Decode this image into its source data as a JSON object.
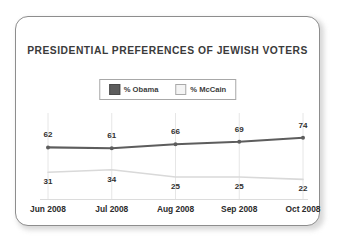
{
  "card": {
    "background": "#ffffff",
    "border_color": "#8d8d8d"
  },
  "chart_data": {
    "type": "line",
    "title": "PRESIDENTIAL PREFERENCES OF JEWISH VOTERS",
    "xlabel": "",
    "ylabel": "",
    "ylim": [
      0,
      100
    ],
    "grid": "vertical-only",
    "legend_position": "top-center",
    "categories": [
      "Jun 2008",
      "Jul 2008",
      "Aug 2008",
      "Sep 2008",
      "Oct 2008"
    ],
    "series": [
      {
        "name": "% Obama",
        "color": "#5d5d5d",
        "marker": "circle",
        "label_position": "above",
        "values": [
          62,
          61,
          66,
          69,
          74
        ]
      },
      {
        "name": "% McCain",
        "color": "#d9d9d9",
        "marker": "none",
        "label_position": "below",
        "values": [
          31,
          34,
          25,
          25,
          22
        ]
      }
    ]
  },
  "legend": {
    "items": [
      {
        "label": "% Obama",
        "swatch": "#5d5d5d",
        "swatch_border": "#4a4a4a"
      },
      {
        "label": "% McCain",
        "swatch": "#f4f4f4",
        "swatch_border": "#a9a9a9"
      }
    ]
  }
}
